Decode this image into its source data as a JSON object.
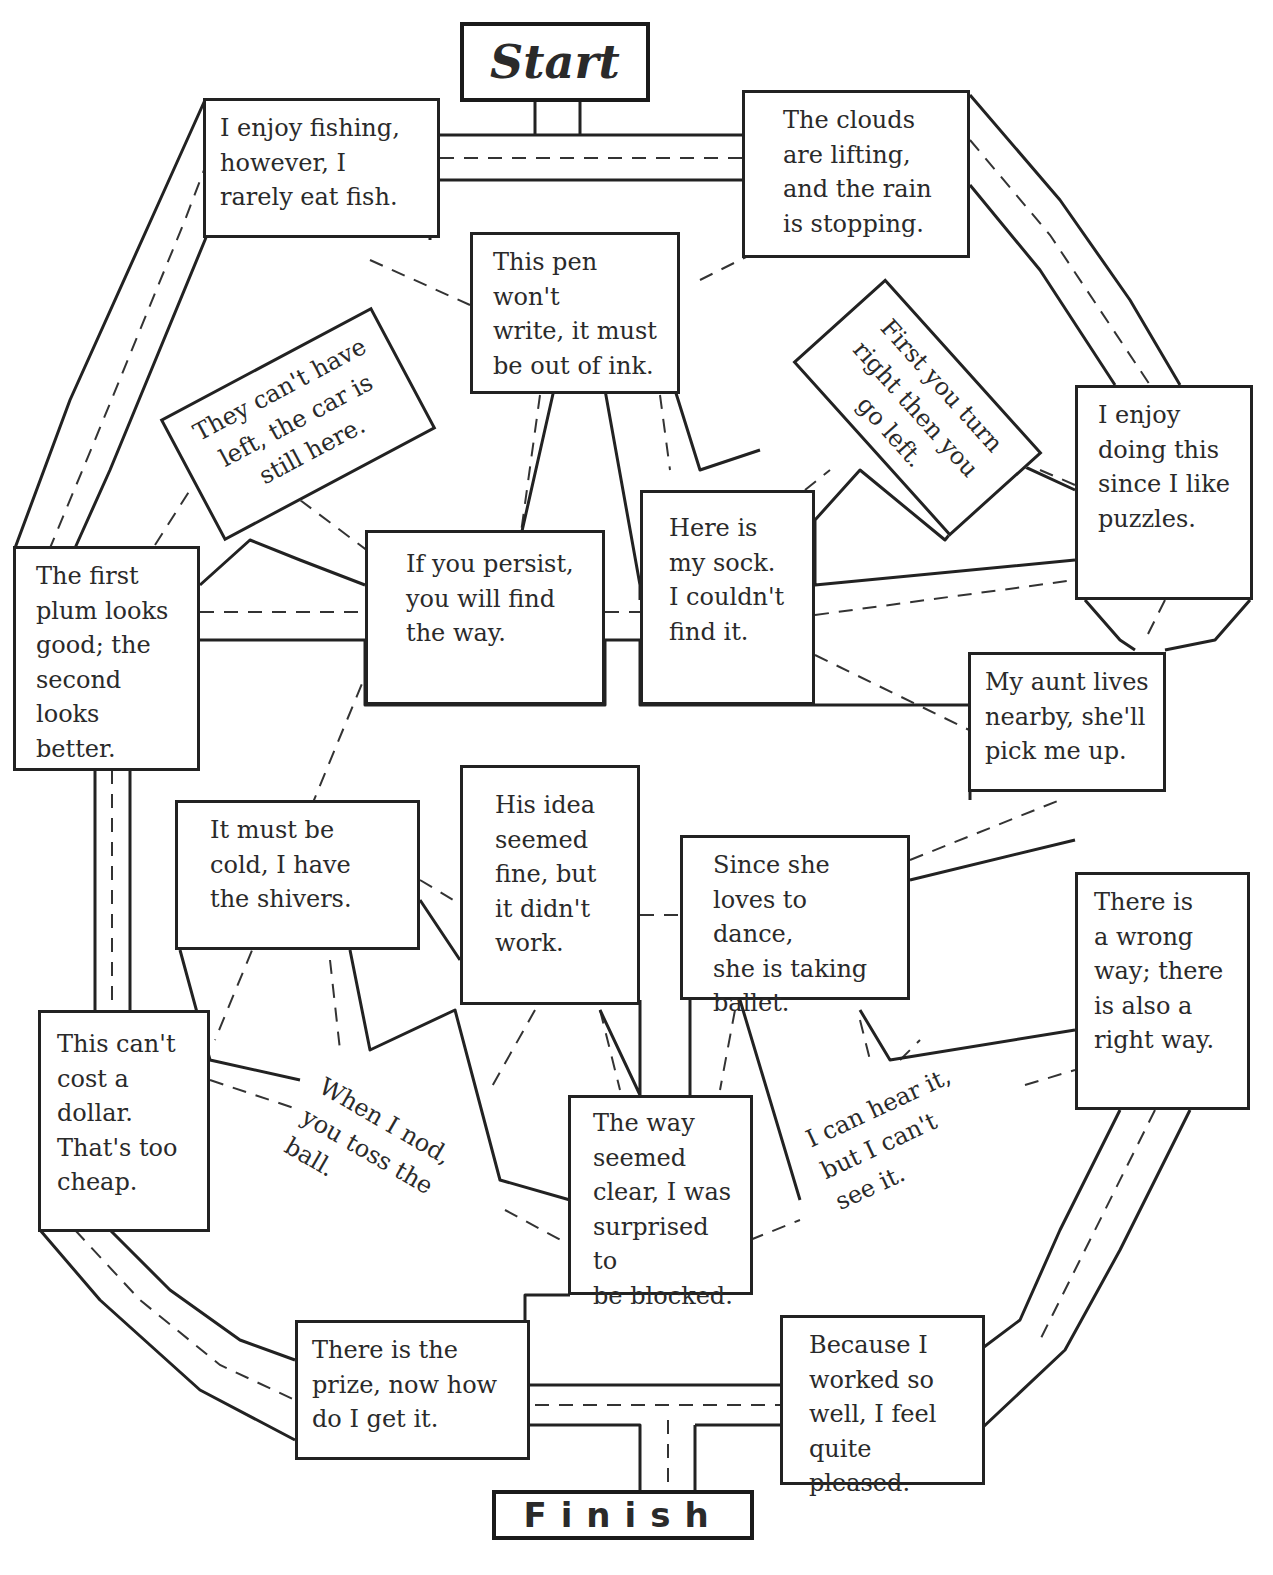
{
  "maze": {
    "start_label": "Start",
    "finish_label": "Finish",
    "boxes": [
      {
        "id": "fishing",
        "text": "I enjoy fishing,\nhowever, I\nrarely eat fish."
      },
      {
        "id": "clouds",
        "text": "The clouds\nare lifting,\nand the rain\nis stopping."
      },
      {
        "id": "pen",
        "text": "This pen won't\nwrite, it must\nbe out of ink."
      },
      {
        "id": "car",
        "text": "They can't have\nleft, the car is\nstill here."
      },
      {
        "id": "turn",
        "text": "First you turn\nright then you\ngo left."
      },
      {
        "id": "puzzles",
        "text": "I enjoy\ndoing this\nsince I like\npuzzles."
      },
      {
        "id": "plum",
        "text": "The first\nplum looks\ngood; the\nsecond\nlooks better."
      },
      {
        "id": "persist",
        "text": "If you persist,\nyou will find\nthe way."
      },
      {
        "id": "sock",
        "text": "Here is\nmy sock.\nI couldn't\nfind it."
      },
      {
        "id": "aunt",
        "text": "My aunt lives\nnearby, she'll\npick me up."
      },
      {
        "id": "cold",
        "text": "It must be\ncold, I have\nthe shivers."
      },
      {
        "id": "idea",
        "text": "His idea\nseemed\nfine, but\nit didn't\nwork."
      },
      {
        "id": "dance",
        "text": "Since she\nloves to dance,\nshe is taking\nballet."
      },
      {
        "id": "wrongway",
        "text": "There is\na wrong\nway; there\nis also a\nright way."
      },
      {
        "id": "dollar",
        "text": "This can't\ncost a\ndollar.\nThat's too\ncheap."
      },
      {
        "id": "nod",
        "text": "When I nod,\nyou toss the\nball."
      },
      {
        "id": "blocked",
        "text": "The way\nseemed\nclear, I was\nsurprised to\nbe blocked."
      },
      {
        "id": "hear",
        "text": "I can hear it,\nbut I can't\nsee it."
      },
      {
        "id": "prize",
        "text": "There is the\nprize, now how\ndo I get it."
      },
      {
        "id": "pleased",
        "text": "Because I\nworked so\nwell, I feel\nquite pleased."
      }
    ]
  }
}
